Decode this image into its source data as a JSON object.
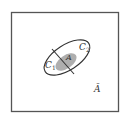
{
  "diagram": {
    "type": "venn-partition",
    "universe": {
      "label": "Ā",
      "name": "complement of A"
    },
    "partition": [
      {
        "label": "C",
        "subscript": "1"
      },
      {
        "label": "C",
        "subscript": "2"
      }
    ],
    "event": {
      "label": "A"
    },
    "colors": {
      "stroke": "#333333",
      "event_fill": "#9a9a9a",
      "background": "#ffffff"
    }
  }
}
